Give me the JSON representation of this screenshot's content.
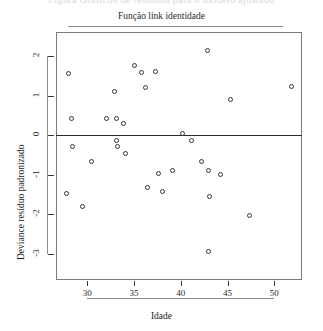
{
  "page": {
    "cropped_top_text": "Figura  Gráficos de resíduos para o modelo ajustado"
  },
  "chart_data": {
    "type": "scatter",
    "title": "Função link identidade",
    "xlabel": "Idade",
    "ylabel": "Deviance resíduo padronizado",
    "xlim": [
      26.5,
      53.5
    ],
    "ylim": [
      -3.35,
      2.4
    ],
    "xticks": [
      30,
      35,
      40,
      45,
      50
    ],
    "yticks": [
      2,
      1,
      0,
      -1,
      -2,
      -3
    ],
    "grid": false,
    "legend": null,
    "reference_line_y": 0,
    "marker": "open-circle",
    "points": [
      {
        "x": 28.0,
        "y": 1.55
      },
      {
        "x": 28.3,
        "y": 0.41
      },
      {
        "x": 28.4,
        "y": -0.3
      },
      {
        "x": 27.8,
        "y": -1.48
      },
      {
        "x": 29.5,
        "y": -1.82
      },
      {
        "x": 30.4,
        "y": -0.68
      },
      {
        "x": 32.0,
        "y": 0.43
      },
      {
        "x": 32.9,
        "y": 1.09
      },
      {
        "x": 33.1,
        "y": 0.43
      },
      {
        "x": 33.1,
        "y": -0.15
      },
      {
        "x": 33.2,
        "y": -0.3
      },
      {
        "x": 33.9,
        "y": 0.28
      },
      {
        "x": 34.1,
        "y": -0.46
      },
      {
        "x": 35.1,
        "y": 1.77
      },
      {
        "x": 35.8,
        "y": 1.57
      },
      {
        "x": 36.2,
        "y": 1.19
      },
      {
        "x": 36.4,
        "y": -1.32
      },
      {
        "x": 37.3,
        "y": 1.62
      },
      {
        "x": 37.6,
        "y": -0.97
      },
      {
        "x": 38.0,
        "y": -1.42
      },
      {
        "x": 39.1,
        "y": -0.9
      },
      {
        "x": 40.2,
        "y": 0.05
      },
      {
        "x": 41.1,
        "y": -0.15
      },
      {
        "x": 42.2,
        "y": -0.66
      },
      {
        "x": 42.9,
        "y": 2.14
      },
      {
        "x": 43.0,
        "y": -0.89
      },
      {
        "x": 43.1,
        "y": -1.55
      },
      {
        "x": 43.0,
        "y": -2.95
      },
      {
        "x": 44.2,
        "y": -0.99
      },
      {
        "x": 45.3,
        "y": 0.89
      },
      {
        "x": 47.4,
        "y": -2.05
      },
      {
        "x": 51.8,
        "y": 1.24
      }
    ]
  }
}
